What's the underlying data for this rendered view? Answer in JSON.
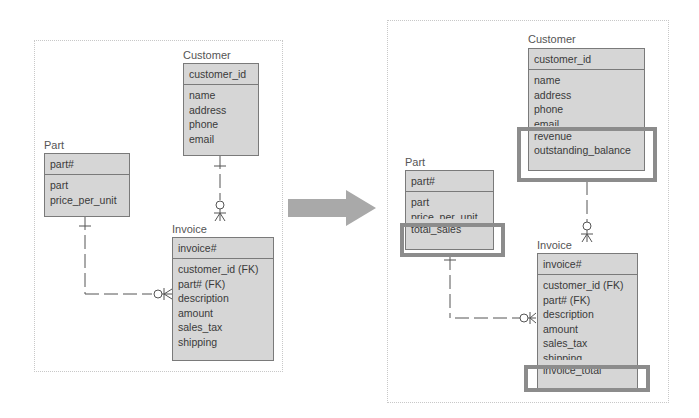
{
  "before": {
    "customer": {
      "label": "Customer",
      "primary_key": "customer_id",
      "attributes": [
        "name",
        "address",
        "phone",
        "email"
      ]
    },
    "part": {
      "label": "Part",
      "primary_key": "part#",
      "attributes": [
        "part",
        "price_per_unit"
      ]
    },
    "invoice": {
      "label": "Invoice",
      "primary_key": "invoice#",
      "attributes": [
        "customer_id (FK)",
        "part# (FK)",
        "description",
        "amount",
        "sales_tax",
        "shipping"
      ]
    }
  },
  "transition_arrow": "right-arrow",
  "after": {
    "customer": {
      "label": "Customer",
      "primary_key": "customer_id",
      "attributes": [
        "name",
        "address",
        "phone",
        "email"
      ],
      "added_attributes": [
        "revenue",
        "outstanding_balance"
      ]
    },
    "part": {
      "label": "Part",
      "primary_key": "part#",
      "attributes": [
        "part",
        "price_per_unit"
      ],
      "added_attributes": [
        "total_sales"
      ]
    },
    "invoice": {
      "label": "Invoice",
      "primary_key": "invoice#",
      "attributes": [
        "customer_id (FK)",
        "part# (FK)",
        "description",
        "amount",
        "sales_tax",
        "shipping"
      ],
      "added_attributes": [
        "invoice_total"
      ]
    }
  },
  "colors": {
    "entity_fill": "#d6d6d6",
    "entity_border": "#7a7a7a",
    "highlight_border": "#8c8c8c",
    "arrow": "#a9a9a9"
  }
}
